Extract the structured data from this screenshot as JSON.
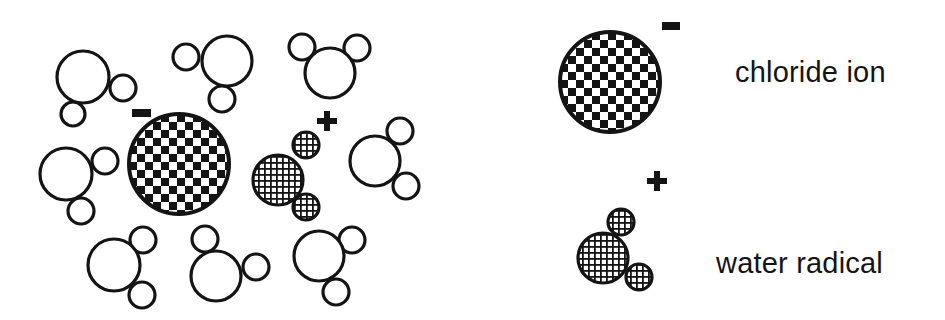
{
  "colors": {
    "ink": "#141414",
    "background": "#ffffff"
  },
  "scene": {
    "description": "Chloride ion and water radical surrounded by water molecules",
    "chloride_ion": {
      "cx": 179,
      "cy": 164,
      "r": 50,
      "fill": "checker",
      "charge": "-",
      "charge_pos": {
        "x": 132,
        "y": 109,
        "w": 19,
        "h": 8
      }
    },
    "water_radical": {
      "fill": "hatch",
      "charge": "+",
      "charge_pos": {
        "cx": 327,
        "cy": 121
      },
      "atoms": [
        {
          "cx": 278,
          "cy": 180,
          "r": 25
        },
        {
          "cx": 306,
          "cy": 145,
          "r": 13
        },
        {
          "cx": 306,
          "cy": 207,
          "r": 13
        }
      ]
    },
    "water_molecules": [
      {
        "atoms": [
          {
            "cx": 83,
            "cy": 77,
            "r": 26
          },
          {
            "cx": 123,
            "cy": 88,
            "r": 13
          },
          {
            "cx": 73,
            "cy": 114,
            "r": 12
          }
        ]
      },
      {
        "atoms": [
          {
            "cx": 227,
            "cy": 61,
            "r": 25
          },
          {
            "cx": 186,
            "cy": 57,
            "r": 13
          },
          {
            "cx": 222,
            "cy": 99,
            "r": 13
          }
        ]
      },
      {
        "atoms": [
          {
            "cx": 330,
            "cy": 73,
            "r": 25
          },
          {
            "cx": 302,
            "cy": 47,
            "r": 13
          },
          {
            "cx": 357,
            "cy": 48,
            "r": 13
          }
        ]
      },
      {
        "atoms": [
          {
            "cx": 66,
            "cy": 174,
            "r": 26
          },
          {
            "cx": 105,
            "cy": 161,
            "r": 13
          },
          {
            "cx": 81,
            "cy": 211,
            "r": 13
          }
        ]
      },
      {
        "atoms": [
          {
            "cx": 375,
            "cy": 161,
            "r": 25
          },
          {
            "cx": 400,
            "cy": 131,
            "r": 13
          },
          {
            "cx": 406,
            "cy": 186,
            "r": 13
          }
        ]
      },
      {
        "atoms": [
          {
            "cx": 114,
            "cy": 265,
            "r": 26
          },
          {
            "cx": 143,
            "cy": 240,
            "r": 13
          },
          {
            "cx": 142,
            "cy": 295,
            "r": 13
          }
        ]
      },
      {
        "atoms": [
          {
            "cx": 216,
            "cy": 276,
            "r": 25
          },
          {
            "cx": 205,
            "cy": 239,
            "r": 13
          },
          {
            "cx": 256,
            "cy": 267,
            "r": 13
          }
        ]
      },
      {
        "atoms": [
          {
            "cx": 319,
            "cy": 256,
            "r": 25
          },
          {
            "cx": 352,
            "cy": 240,
            "r": 13
          },
          {
            "cx": 336,
            "cy": 292,
            "r": 13
          }
        ]
      }
    ]
  },
  "legend": {
    "items": [
      {
        "label": "chloride ion",
        "symbol": "checker-circle",
        "charge": "-",
        "shape": {
          "cx": 610,
          "cy": 82,
          "r": 50
        },
        "charge_pos": {
          "x": 662,
          "y": 22,
          "w": 18,
          "h": 8
        }
      },
      {
        "label": "water radical",
        "symbol": "hatched-molecule",
        "charge": "+",
        "charge_pos": {
          "cx": 657,
          "cy": 181
        },
        "atoms": [
          {
            "cx": 603,
            "cy": 258,
            "r": 25
          },
          {
            "cx": 621,
            "cy": 222,
            "r": 13
          },
          {
            "cx": 639,
            "cy": 277,
            "r": 13
          }
        ]
      }
    ]
  }
}
